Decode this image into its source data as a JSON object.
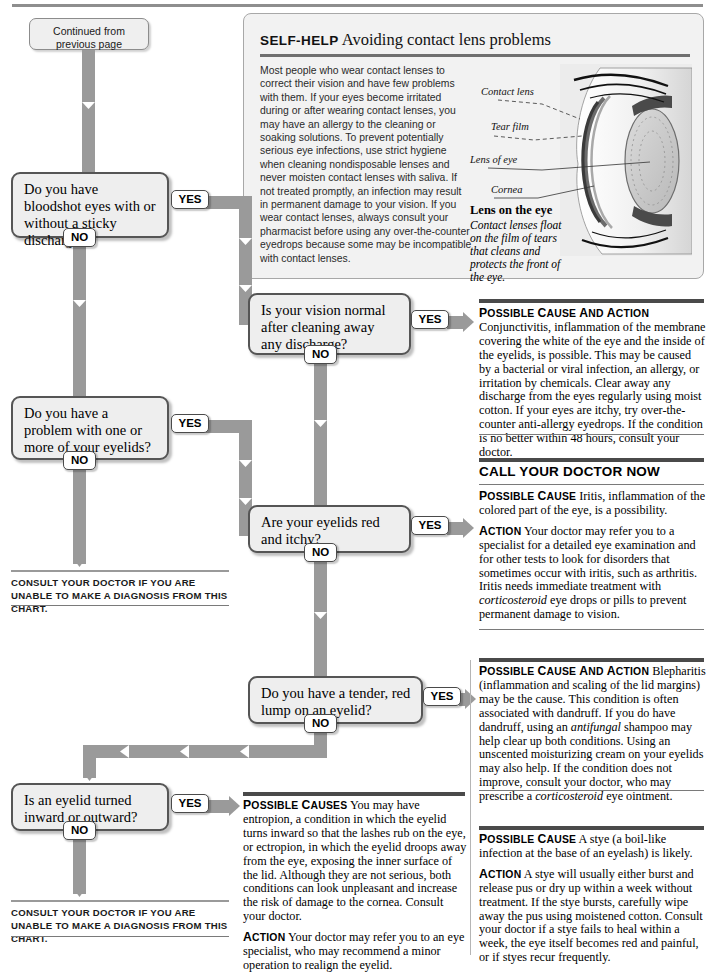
{
  "page": {
    "top_rule": true
  },
  "continued": {
    "line1": "Continued from",
    "line2": "previous page"
  },
  "self_help": {
    "kicker": "SELF-HELP",
    "title": "Avoiding contact lens problems",
    "body": "Most people who wear contact lenses to correct their vision and have few problems with them. If your eyes become irritated during or after wearing contact lenses, you may have an allergy to the cleaning or soaking solutions. To prevent potentially serious eye infections, use strict hygiene when cleaning nondisposable lenses and never moisten contact lenses with saliva. If not treated promptly, an infection may result in permanent damage to your vision. If you wear contact lenses, always consult your pharmacist before using any over-the-counter eyedrops because some may be incompatible with contact lenses.",
    "artwork_labels": [
      "Contact lens",
      "Tear film",
      "Lens of eye",
      "Cornea"
    ],
    "caption_heading": "Lens on the eye",
    "caption_body": "Contact lenses float on the film of tears that cleans and protects the front of the eye."
  },
  "answers": {
    "yes_label": "YES",
    "no_label": "NO"
  },
  "questions": [
    {
      "id": "q1",
      "text": "Do you have bloodshot eyes with or without a sticky discharge?"
    },
    {
      "id": "q2",
      "text": "Is your vision normal after cleaning away any discharge?"
    },
    {
      "id": "q3",
      "text": "Do you have a problem with one or more of your eyelids?"
    },
    {
      "id": "q4",
      "text": "Are your eyelids red and itchy?"
    },
    {
      "id": "q5",
      "text": "Do you have a tender, red lump on an eyelid?"
    },
    {
      "id": "q6",
      "text": "Is an eyelid turned inward or outward?"
    }
  ],
  "consult_notes": [
    "Consult your doctor if you are unable to make a diagnosis from this chart.",
    "Consult your doctor if you are unable to make a diagnosis from this chart."
  ],
  "call_doctor_now": "CALL YOUR DOCTOR NOW",
  "results": {
    "conjunctivitis": {
      "label": "Possible cause and action",
      "text": "Conjunctivitis, inflammation of the membrane covering the white of the eye and the inside of the eyelids, is possible. This may be caused by a bacterial or viral infection, an allergy, or irritation by chemicals. Clear away any discharge from the eyes regularly using moist cotton. If your eyes are itchy, try over-the-counter anti-allergy eyedrops. If the condition is no better within 48 hours, consult your doctor."
    },
    "iritis": {
      "cause_label": "Possible cause",
      "cause_text": "Iritis, inflammation of the colored part of the eye, is a possibility.",
      "action_label": "Action",
      "action_text": "Your doctor may refer you to a specialist for a detailed eye examination and for other tests to look for disorders that sometimes occur with iritis, such as arthritis. Iritis needs immediate treatment with corticosteroid eye drops or pills to prevent permanent damage to vision.",
      "action_italic": "corticosteroid"
    },
    "blepharitis": {
      "label": "Possible cause and action",
      "text": "Blepharitis (inflammation and scaling of the lid margins) may be the cause. This condition is often associated with dandruff. If you do have dandruff, using an antifungal shampoo may help clear up both conditions. Using an unscented moisturizing cream on your eyelids may also help. If the condition does not improve, consult your doctor, who may prescribe a corticosteroid eye ointment.",
      "italic_1": "antifungal",
      "italic_2": "corticosteroid"
    },
    "stye": {
      "cause_label": "Possible cause",
      "cause_text": "A stye (a boil-like infection at the base of an eyelash) is likely.",
      "action_label": "Action",
      "action_text": "A stye will usually either burst and release pus or dry up within a week without treatment. If the stye bursts, carefully wipe away the pus using moistened cotton. Consult your doctor if a stye fails to heal within a week, the eye itself becomes red and painful, or if styes recur frequently."
    },
    "entropion": {
      "cause_label": "Possible causes",
      "cause_text": "You may have entropion, a condition in which the eyelid turns inward so that the lashes rub on the eye, or ectropion, in which the eyelid droops away from the eye, exposing the inner surface of the lid. Although they are not serious, both conditions can look unpleasant and increase the risk of damage to the cornea. Consult your doctor.",
      "action_label": "Action",
      "action_text": "Your doctor may refer you to an eye specialist, who may recommend a minor operation to realign the eyelid."
    }
  },
  "colors": {
    "connector": "#9a9a9a",
    "box_fill": "#eeeeee",
    "box_border": "#555555",
    "rule": "#4a4a4a"
  }
}
